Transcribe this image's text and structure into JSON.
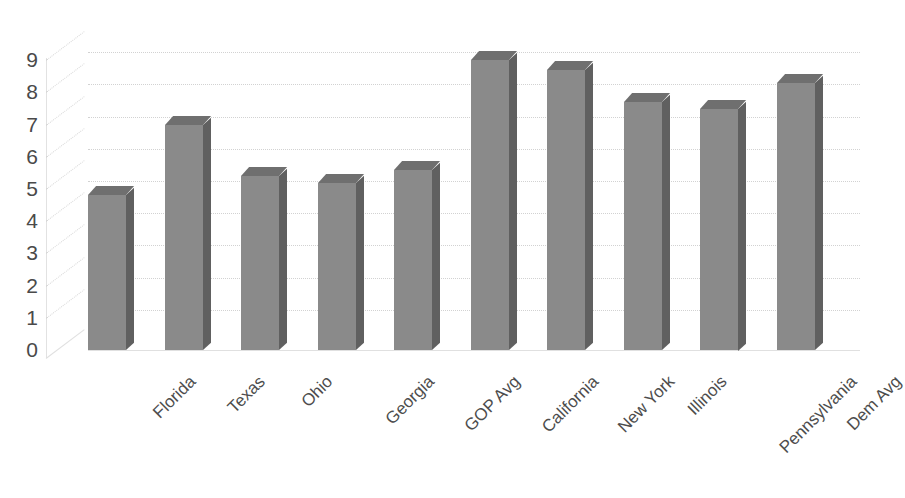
{
  "chart_data": {
    "type": "bar",
    "title": "",
    "subtitle": "",
    "xlabel": "",
    "ylabel": "",
    "ylim": [
      0,
      9
    ],
    "grid": true,
    "legend": false,
    "style": "3d-column",
    "categories": [
      "Florida",
      "Texas",
      "Ohio",
      "Georgia",
      "GOP Avg",
      "California",
      "New York",
      "Illinois",
      "Pennsylvania",
      "Dem Avg"
    ],
    "values": [
      4.8,
      7.0,
      5.4,
      5.2,
      5.6,
      9.0,
      8.7,
      7.7,
      7.5,
      8.3
    ],
    "ytick_labels": [
      "9",
      "8",
      "7",
      "6",
      "5",
      "4",
      "3",
      "2",
      "1",
      "0"
    ],
    "ytick_values": [
      9,
      8,
      7,
      6,
      5,
      4,
      3,
      2,
      1,
      0
    ],
    "colors": {
      "bar_front": "#8a8a8a",
      "bar_top": "#6f6f6f",
      "bar_side": "#606060",
      "gridline": "#d2d2d2",
      "text": "#4a4a4a",
      "background": "#ffffff"
    }
  }
}
